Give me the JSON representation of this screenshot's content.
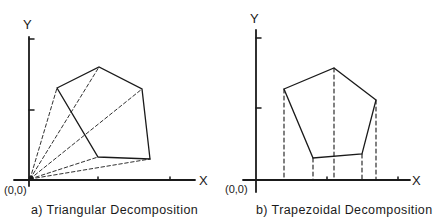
{
  "panels": [
    {
      "id": "a",
      "caption": "a) Triangular  Decomposition",
      "y_label": "Y",
      "x_label": "X",
      "origin_label": "(0,0)",
      "method": "triangular",
      "polygon_vertices": [
        [
          57,
          88
        ],
        [
          99,
          67
        ],
        [
          142,
          89
        ],
        [
          150,
          159
        ],
        [
          98,
          157
        ]
      ],
      "origin": [
        30,
        179
      ],
      "decomposition_lines": "dashed rays from origin to each vertex"
    },
    {
      "id": "b",
      "caption": "b) Trapezoidal  Decomposition",
      "y_label": "Y",
      "x_label": "X",
      "origin_label": "(0,0)",
      "method": "trapezoidal",
      "polygon_vertices": [
        [
          284,
          89
        ],
        [
          334,
          68
        ],
        [
          376,
          100
        ],
        [
          362,
          154
        ],
        [
          313,
          158
        ]
      ],
      "origin": [
        256,
        180
      ],
      "decomposition_lines": "dashed vertical projections from each vertex to X axis"
    }
  ],
  "colors": {
    "ink": "#1a1a1a",
    "background": "#ffffff"
  }
}
